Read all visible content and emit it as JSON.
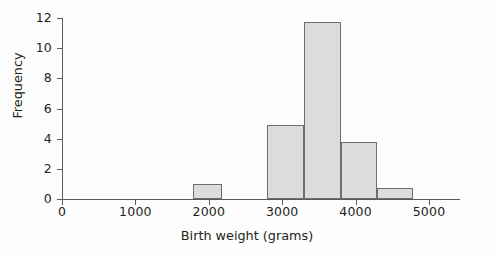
{
  "chart_data": {
    "type": "bar",
    "title": "",
    "subtitle": "",
    "xlabel": "Birth weight (grams)",
    "ylabel": "Frequency",
    "xlim": [
      0,
      5420
    ],
    "ylim": [
      0,
      12
    ],
    "grid": false,
    "legend": null,
    "bin_width": 500,
    "x_ticks": [
      {
        "value": 0,
        "label": "0"
      },
      {
        "value": 1000,
        "label": "1000"
      },
      {
        "value": 2000,
        "label": "2000"
      },
      {
        "value": 3000,
        "label": "3000"
      },
      {
        "value": 4000,
        "label": "4000"
      },
      {
        "value": 5000,
        "label": "5000"
      }
    ],
    "y_ticks": [
      {
        "value": 0,
        "label": "0"
      },
      {
        "value": 2,
        "label": "2"
      },
      {
        "value": 4,
        "label": "4"
      },
      {
        "value": 6,
        "label": "6"
      },
      {
        "value": 8,
        "label": "8"
      },
      {
        "value": 10,
        "label": "10"
      },
      {
        "value": 12,
        "label": "12"
      }
    ],
    "bins": [
      {
        "x0": 1790,
        "x1": 2180,
        "value": 1.0
      },
      {
        "x0": 2790,
        "x1": 3300,
        "value": 4.9
      },
      {
        "x0": 3300,
        "x1": 3800,
        "value": 11.75
      },
      {
        "x0": 3800,
        "x1": 4290,
        "value": 3.8
      },
      {
        "x0": 4290,
        "x1": 4780,
        "value": 0.75
      }
    ],
    "categories": [
      "1790-2180",
      "2790-3300",
      "3300-3800",
      "3800-4290",
      "4290-4780"
    ],
    "values": [
      1.0,
      4.9,
      11.75,
      3.8,
      0.75
    ],
    "colors": {
      "bar_fill": "#dcdcdc",
      "bar_stroke": "#6e6e6e",
      "axis": "#5a5a5a",
      "text": "#231f20",
      "background": "#fdfdfd"
    }
  }
}
